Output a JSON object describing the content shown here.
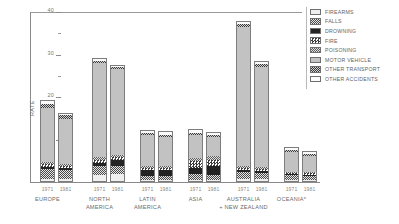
{
  "chart_data": {
    "type": "bar",
    "subtype": "stacked-grouped",
    "title": "",
    "xlabel": "",
    "ylabel": "RATE",
    "ylim": [
      0,
      40
    ],
    "yticks": [
      0,
      10,
      20,
      30,
      40
    ],
    "ytick_labels": [
      "0",
      "10",
      "20",
      "30",
      "40"
    ],
    "yminor_ticks": [
      5,
      15,
      25,
      35
    ],
    "grid": false,
    "legend_position": "right",
    "categories": [
      "EUROPE",
      "NORTH AMERICA",
      "LATIN AMERICA",
      "ASIA",
      "AUSTRALIA + NEW ZEALAND",
      "OCEANIA*"
    ],
    "subcategories": [
      "1971",
      "1981"
    ],
    "series": [
      {
        "name": "FIREARMS",
        "values": [
          [
            0.4,
            0.4
          ],
          [
            1.5,
            1.6
          ],
          [
            0.3,
            0.3
          ],
          [
            0.2,
            0.2
          ],
          [
            0.5,
            0.4
          ],
          [
            0.3,
            0.3
          ]
        ]
      },
      {
        "name": "FALLS",
        "values": [
          [
            2.6,
            2.3
          ],
          [
            2.1,
            2.0
          ],
          [
            1.0,
            1.0
          ],
          [
            1.4,
            1.2
          ],
          [
            1.6,
            1.5
          ],
          [
            1.1,
            1.0
          ]
        ]
      },
      {
        "name": "DROWNING",
        "values": [
          [
            0.5,
            0.4
          ],
          [
            0.7,
            1.4
          ],
          [
            1.5,
            1.5
          ],
          [
            1.7,
            2.3
          ],
          [
            0.5,
            0.5
          ],
          [
            0.3,
            0.3
          ]
        ]
      },
      {
        "name": "FIRE",
        "values": [
          [
            0.5,
            0.5
          ],
          [
            0.8,
            0.7
          ],
          [
            0.4,
            0.4
          ],
          [
            1.6,
            1.5
          ],
          [
            0.4,
            0.4
          ],
          [
            0.3,
            0.3
          ]
        ]
      },
      {
        "name": "POISONING",
        "values": [
          [
            0.6,
            0.6
          ],
          [
            0.7,
            0.6
          ],
          [
            0.5,
            0.5
          ],
          [
            0.8,
            0.9
          ],
          [
            0.6,
            0.6
          ],
          [
            0.3,
            0.3
          ]
        ]
      },
      {
        "name": "MOTOR VEHICLE",
        "values": [
          [
            13.0,
            10.8
          ],
          [
            22.5,
            20.5
          ],
          [
            7.5,
            7.2
          ],
          [
            5.5,
            4.6
          ],
          [
            33.0,
            24.0
          ],
          [
            5.0,
            4.2
          ]
        ]
      },
      {
        "name": "OTHER TRANSPORT",
        "values": [
          [
            1.1,
            0.9
          ],
          [
            0.5,
            0.5
          ],
          [
            0.5,
            0.5
          ],
          [
            0.6,
            0.6
          ],
          [
            0.8,
            0.7
          ],
          [
            0.5,
            0.5
          ]
        ]
      },
      {
        "name": "OTHER ACCIDENTS",
        "values": [
          [
            0.5,
            0.4
          ],
          [
            0.4,
            0.3
          ],
          [
            0.5,
            0.5
          ],
          [
            0.6,
            0.5
          ],
          [
            0.4,
            0.3
          ],
          [
            0.4,
            0.4
          ]
        ]
      }
    ],
    "totals": [
      [
        19.2,
        16.3
      ],
      [
        29.2,
        27.6
      ],
      [
        12.2,
        11.9
      ],
      [
        12.4,
        11.8
      ],
      [
        37.8,
        28.4
      ],
      [
        8.2,
        7.3
      ]
    ]
  },
  "axis": {
    "y_title": "RATE",
    "y_labels": [
      "40",
      "30",
      "20",
      "10",
      "0"
    ]
  },
  "groups": [
    {
      "region": "EUROPE",
      "region_line2": "",
      "years": [
        "1971",
        "1981"
      ]
    },
    {
      "region": "NORTH",
      "region_line2": "AMERICA",
      "years": [
        "1971",
        "1981"
      ]
    },
    {
      "region": "LATIN",
      "region_line2": "AMERICA",
      "years": [
        "1971",
        "1981"
      ]
    },
    {
      "region": "ASIA",
      "region_line2": "",
      "years": [
        "1971",
        "1981"
      ]
    },
    {
      "region": "AUSTRALIA",
      "region_line2": "+ NEW ZEALAND",
      "years": [
        "1971",
        "1981"
      ]
    },
    {
      "region": "OCEANIA*",
      "region_line2": "",
      "years": [
        "1971",
        "1981"
      ]
    }
  ],
  "legend": {
    "items": [
      {
        "label": "FIREARMS",
        "swatch": "firearms-swatch"
      },
      {
        "label": "FALLS",
        "swatch": "falls-swatch"
      },
      {
        "label": "DROWNING",
        "swatch": "drowning-swatch"
      },
      {
        "label": "FIRE",
        "swatch": "fire-swatch"
      },
      {
        "label": "POISONING",
        "swatch": "poisoning-swatch"
      },
      {
        "label": "MOTOR VEHICLE",
        "swatch": "motor-vehicle-swatch"
      },
      {
        "label": "OTHER TRANSPORT",
        "swatch": "other-transport-swatch"
      },
      {
        "label": "OTHER ACCIDENTS",
        "swatch": "other-accidents-swatch"
      }
    ]
  },
  "colors": {
    "axis": "#8a8a8a",
    "text": "#6b6b6b",
    "bar_outline": "#7d7d7d",
    "motor_vehicle": "#c2c2c2",
    "drowning": "#232323",
    "firearms": "#efefef"
  }
}
